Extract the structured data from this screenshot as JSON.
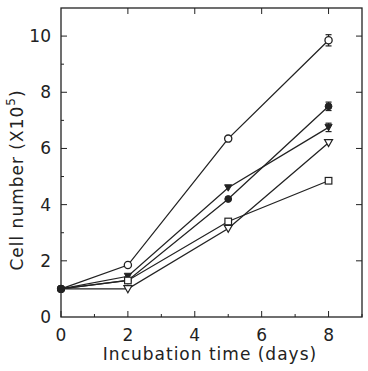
{
  "chart_data": {
    "type": "line",
    "title": "",
    "xlabel": "Incubation time (days)",
    "ylabel": "Cell number (X10",
    "ylabel_superscript": "5",
    "ylabel_suffix": ")",
    "xlim": [
      0,
      9
    ],
    "ylim": [
      0,
      11
    ],
    "x_ticks": [
      0,
      2,
      4,
      6,
      8
    ],
    "y_ticks": [
      0,
      2,
      4,
      6,
      8,
      10
    ],
    "grid": false,
    "legend": "none",
    "x": [
      0,
      2,
      5,
      8
    ],
    "series": [
      {
        "name": "open-circle",
        "marker": "circle-open",
        "values": [
          1.0,
          1.85,
          6.35,
          9.85
        ],
        "error_last": 0.2
      },
      {
        "name": "filled-circle",
        "marker": "circle-filled",
        "values": [
          1.0,
          1.3,
          4.2,
          7.5
        ],
        "error_last": 0.15
      },
      {
        "name": "filled-triangle-down",
        "marker": "triangle-down-filled",
        "values": [
          1.0,
          1.45,
          4.6,
          6.75
        ],
        "error_last": 0.15
      },
      {
        "name": "open-triangle-down",
        "marker": "triangle-down-open",
        "values": [
          1.0,
          1.0,
          3.15,
          6.2
        ],
        "error_last": 0
      },
      {
        "name": "open-square",
        "marker": "square-open",
        "values": [
          1.0,
          1.3,
          3.4,
          4.85
        ],
        "error_last": 0
      }
    ]
  },
  "axes": {
    "x_tick_labels": [
      "0",
      "2",
      "4",
      "6",
      "8"
    ],
    "y_tick_labels": [
      "0",
      "2",
      "4",
      "6",
      "8",
      "10"
    ]
  },
  "colors": {
    "line": "#222222",
    "background": "#ffffff"
  }
}
